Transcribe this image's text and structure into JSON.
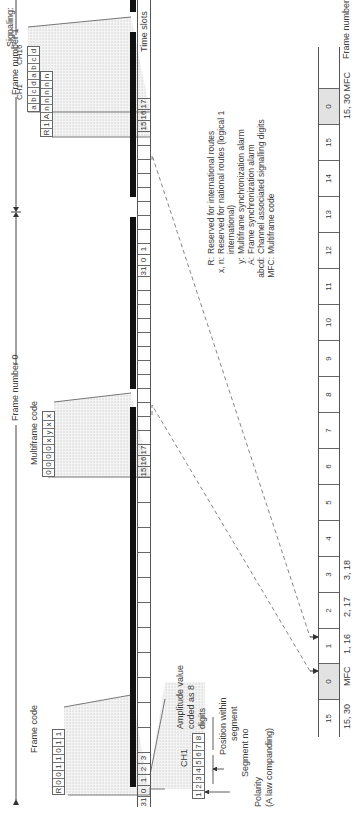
{
  "frame_labels": {
    "frame0": "Frame number 0",
    "frame1": "Frame number 1",
    "time_slots": "Time slots",
    "frame_numbers": "Frame numbers"
  },
  "frame0": {
    "slots_visible": [
      "31",
      "0",
      "1",
      "2",
      "3",
      "",
      "",
      "",
      "",
      "",
      "",
      "",
      "",
      "",
      "",
      "15",
      "16",
      "17",
      "",
      "",
      "",
      "",
      "",
      "",
      "",
      "",
      "",
      "",
      "",
      "",
      "",
      ""
    ],
    "frame_code": {
      "label": "Frame code",
      "bits": [
        "R",
        "0",
        "0",
        "1",
        "1",
        "0",
        "1",
        "1"
      ]
    },
    "multiframe_code": {
      "label": "Multiframe code",
      "bits": [
        "0",
        "0",
        "0",
        "0",
        "x",
        "y",
        "x",
        "x"
      ]
    },
    "ch1": {
      "label": "CH1",
      "amplitude_label": "Amplitude value coded as 8 digits",
      "amplitude_line1": "Amplitude value",
      "amplitude_line2": "coded as 8",
      "amplitude_line3": "digits",
      "bits": [
        "1",
        "2",
        "3",
        "4",
        "5",
        "6",
        "7",
        "8"
      ],
      "polarity_line1": "Polarity",
      "polarity_line2": "(A law companding)",
      "segment_label": "Segment no",
      "position_line1": "Position within",
      "position_line2": "segment"
    }
  },
  "frame1": {
    "nfas_bits": [
      "R",
      "1",
      "A",
      "n",
      "n",
      "n",
      "n",
      "n"
    ],
    "signaling": {
      "label": "Signaling:",
      "ch1_label": "CH1",
      "ch16_label": "CH16",
      "bits": [
        "a",
        "b",
        "c",
        "d",
        "a",
        "b",
        "c",
        "d"
      ]
    }
  },
  "slot_labels": {
    "s31": "31",
    "s0": "0",
    "s1": "1",
    "s2": "2",
    "s3": "3",
    "s15": "15",
    "s16": "16",
    "s17": "17"
  },
  "legend": [
    {
      "key": "R:",
      "text": "Reserved for international routes"
    },
    {
      "key": "x, n:",
      "text": "Reserved for national routes (logical 1"
    },
    {
      "key": "",
      "text": "international)"
    },
    {
      "key": "y:",
      "text": "Multiframe synchronization alarm"
    },
    {
      "key": "A:",
      "text": "Frame synchronization alarm"
    },
    {
      "key": "abcd:",
      "text": "Channel associated signalling digits"
    },
    {
      "key": "MFC:",
      "text": "Multiframe code"
    }
  ],
  "frame_numbers": {
    "cells": [
      "15",
      "0",
      "1",
      "2",
      "3",
      "4",
      "5",
      "6",
      "7",
      "8",
      "9",
      "10",
      "11",
      "12",
      "13",
      "14",
      "15",
      "0"
    ],
    "below": [
      {
        "text": "15, 30",
        "x": 88
      },
      {
        "text": "MFC",
        "x": 131
      },
      {
        "text": "1, 16",
        "x": 163
      },
      {
        "text": "2, 17",
        "x": 200
      },
      {
        "text": "3, 18",
        "x": 237
      },
      {
        "text": "15, 30 MFC",
        "x": 698
      }
    ]
  }
}
